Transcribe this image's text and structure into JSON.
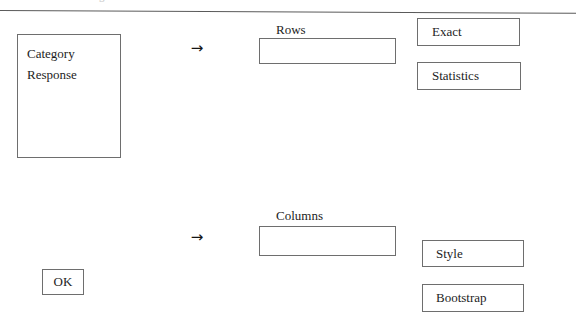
{
  "page": {
    "clipped_header_text": "mmm mmmm mmm g"
  },
  "variable_list": {
    "items": [
      {
        "label": "Category"
      },
      {
        "label": "Response"
      }
    ]
  },
  "transfer_controls": {
    "rows_arrow": "→",
    "columns_arrow": "→",
    "rows_arrow_icon_name": "arrow-right-icon",
    "columns_arrow_icon_name": "arrow-right-icon"
  },
  "fields": {
    "rows": {
      "label": "Rows",
      "value": ""
    },
    "columns": {
      "label": "Columns",
      "value": ""
    }
  },
  "buttons": {
    "exact": "Exact",
    "statistics": "Statistics",
    "style": "Style",
    "bootstrap": "Bootstrap",
    "ok": "OK"
  },
  "colors": {
    "background": "#ffffff",
    "border": "#6e6e6e",
    "text": "#1d1d1d",
    "rule": "#5a5a5a"
  }
}
